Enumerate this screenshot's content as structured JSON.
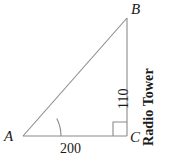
{
  "figure": {
    "type": "right-triangle-diagram",
    "background_color": "#ffffff",
    "line_color": "#8a8a8a",
    "text_color": "#1a1a1a",
    "vertices": {
      "a": {
        "label": "A",
        "x": 23,
        "y": 136
      },
      "b": {
        "label": "B",
        "x": 127,
        "y": 18
      },
      "c": {
        "label": "C",
        "x": 127,
        "y": 136
      }
    },
    "sides": {
      "base": {
        "from": "A",
        "to": "C",
        "label": "200"
      },
      "height": {
        "from": "B",
        "to": "C",
        "label": "110"
      },
      "hypotenuse": {
        "from": "A",
        "to": "B",
        "label": ""
      }
    },
    "annotations": {
      "angle_arc_at": "A",
      "angle_arc_radius": 38,
      "right_angle_at": "C",
      "right_angle_size": 14,
      "tower_caption": "Radio Tower"
    }
  }
}
